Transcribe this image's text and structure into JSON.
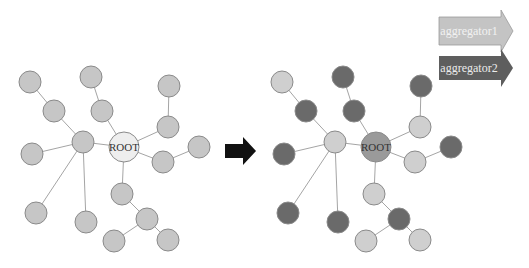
{
  "diagram": {
    "root_label": "ROOT",
    "legend": [
      {
        "label": "aggregator1",
        "fill": "#c4c4c4",
        "text_color": "#f2f2f2"
      },
      {
        "label": "aggregator2",
        "fill": "#5e5e5e",
        "text_color": "#ececec"
      }
    ],
    "colors": {
      "left_node": "#c6c6c6",
      "left_root": "#eeeeee",
      "aggregator1": "#cfcfcf",
      "aggregator2": "#6a6a6a",
      "right_root": "#9a9a9a",
      "edge": "#9a9a9a",
      "stroke": "#8a8a8a",
      "arrow": "#111111"
    },
    "transform_arrow": "right-arrow"
  }
}
